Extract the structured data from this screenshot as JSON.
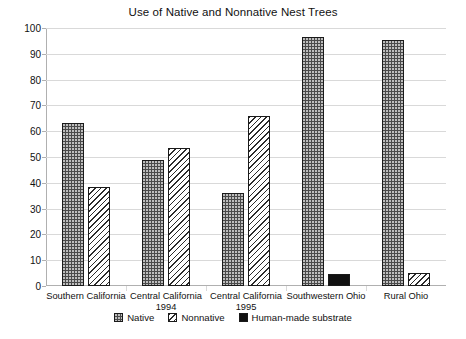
{
  "chart_data": {
    "type": "bar",
    "title": "Use of Native and Nonnative Nest Trees",
    "xlabel": "",
    "ylabel": "",
    "ylim": [
      0,
      100
    ],
    "ytick_labels": [
      "0",
      "10",
      "20",
      "30",
      "40",
      "50",
      "60",
      "70",
      "80",
      "90",
      "100"
    ],
    "ytick_values": [
      0,
      10,
      20,
      30,
      40,
      50,
      60,
      70,
      80,
      90,
      100
    ],
    "grid": true,
    "legend_position": "bottom",
    "categories": [
      "Southern California",
      "Central California 1994",
      "Central California 1995",
      "Southwestern Ohio",
      "Rural Ohio"
    ],
    "category_lines": [
      [
        "Southern California"
      ],
      [
        "Central California",
        "1994"
      ],
      [
        "Central California",
        "1995"
      ],
      [
        "Southwestern Ohio"
      ],
      [
        "Rural Ohio"
      ]
    ],
    "series": [
      {
        "name": "Native",
        "fill": "dotted-dark",
        "values": [
          63,
          49,
          36,
          96.5,
          95.5
        ]
      },
      {
        "name": "Nonnative",
        "fill": "diagonal-hatch",
        "values": [
          38.5,
          53.5,
          66,
          null,
          5
        ]
      },
      {
        "name": "Human-made substrate",
        "fill": "solid-black",
        "values": [
          null,
          null,
          null,
          4.5,
          null
        ]
      }
    ]
  },
  "legend": {
    "items": [
      {
        "label": "Native"
      },
      {
        "label": "Nonnative"
      },
      {
        "label": "Human-made substrate"
      }
    ]
  },
  "colors": {
    "native": "#4a4a4a",
    "nonnative": "#ffffff",
    "human": "#111111",
    "grid": "#d9d9d9",
    "axis": "#b0b0b0",
    "text": "#111111"
  }
}
